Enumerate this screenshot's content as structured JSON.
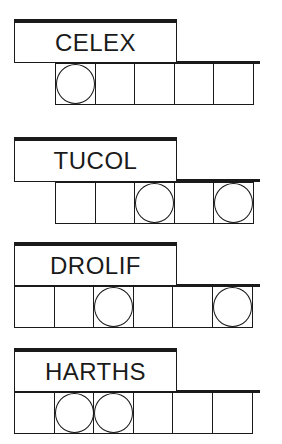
{
  "puzzles": [
    {
      "word": "CELEX",
      "letters": 5,
      "circled": [
        0
      ]
    },
    {
      "word": "TUCOL",
      "letters": 5,
      "circled": [
        2,
        4
      ]
    },
    {
      "word": "DROLIF",
      "letters": 6,
      "circled": [
        2,
        5
      ]
    },
    {
      "word": "HARTHS",
      "letters": 6,
      "circled": [
        1,
        2
      ]
    }
  ],
  "colors": {
    "ink": "#1a1a1a",
    "background": "#ffffff"
  }
}
